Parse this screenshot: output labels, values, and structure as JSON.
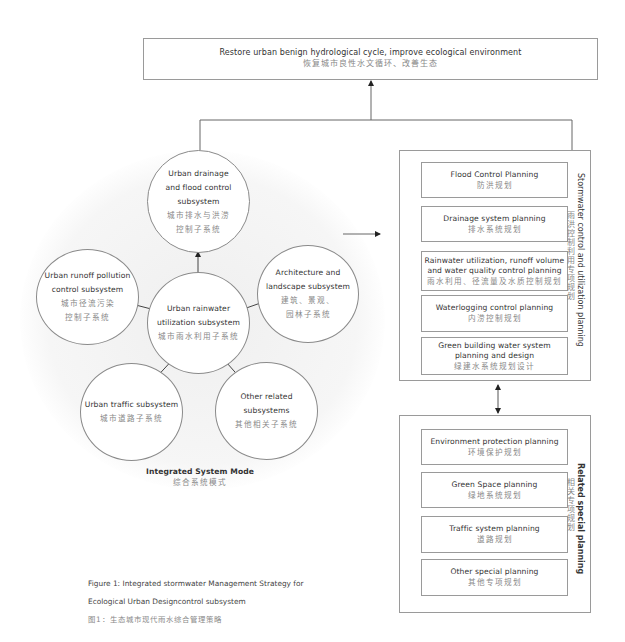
{
  "goal": {
    "en": "Restore urban benign hydrological cycle, improve ecological environment",
    "zh": "恢复城市良性水文循环、改善生态"
  },
  "integrated_mode": {
    "title_en": "Integrated System Mode",
    "title_zh": "综合系统模式",
    "center": {
      "en_line1": "Urban rainwater",
      "en_line2": "utilization subsystem",
      "zh": "城市雨水利用子系统"
    },
    "subsystems": [
      {
        "id": "drainage",
        "en_lines": [
          "Urban drainage",
          "and flood control",
          "subsystem"
        ],
        "zh_lines": [
          "城市排水与洪涝",
          "控制子系统"
        ]
      },
      {
        "id": "runoff",
        "en_lines": [
          "Urban runoff pollution",
          "control subsystem"
        ],
        "zh_lines": [
          "城市径流污染",
          "控制子系统"
        ]
      },
      {
        "id": "architecture",
        "en_lines": [
          "Architecture and",
          "landscape subsystem"
        ],
        "zh_lines": [
          "建筑、景观、",
          "园林子系统"
        ]
      },
      {
        "id": "traffic",
        "en_lines": [
          "Urban traffic subsystem"
        ],
        "zh_lines": [
          "城市道路子系统"
        ]
      },
      {
        "id": "other",
        "en_lines": [
          "Other related",
          "subsystems"
        ],
        "zh_lines": [
          "其他相关子系统"
        ]
      }
    ]
  },
  "stormwater_panel": {
    "label_en": "Stormwater control and utilization planning",
    "label_zh": "雨洪控制利用专项规划",
    "items": [
      {
        "en": "Flood Control Planning",
        "zh": "防洪规划"
      },
      {
        "en": "Drainage system planning",
        "zh": "排水系统规划"
      },
      {
        "en_line1": "Rainwater utilization, runoff volume",
        "en_line2": "and water quality control planning",
        "zh": "雨水利用、径流量及水质控制规划"
      },
      {
        "en": "Waterlogging control planning",
        "zh": "内涝控制规划"
      },
      {
        "en_line1": "Green building water system",
        "en_line2": "planning and design",
        "zh": "绿建水系统规划设计"
      }
    ]
  },
  "related_panel": {
    "label_en": "Related special planning",
    "label_zh": "相关专项规划",
    "items": [
      {
        "en": "Environment protection planning",
        "zh": "环境保护规划"
      },
      {
        "en": "Green Space planning",
        "zh": "绿地系统规划"
      },
      {
        "en": "Traffic system planning",
        "zh": "道路规划"
      },
      {
        "en": "Other special planning",
        "zh": "其他专项规划"
      }
    ]
  },
  "caption": {
    "line1": "Figure 1: Integrated stormwater Management Strategy for",
    "line2": "Ecological Urban Designcontrol subsystem",
    "line3": "图1：生态城市现代雨水综合管理策略"
  },
  "colors": {
    "line": "#555555",
    "box_border": "#9a9a9a",
    "text_en": "#333333",
    "text_zh": "#888888",
    "halo": "#f3f3f3"
  }
}
